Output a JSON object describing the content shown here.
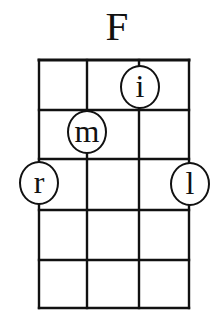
{
  "chord": {
    "name": "F",
    "strings": 4,
    "frets": 5,
    "grid": {
      "left": 39,
      "top": 60,
      "column_x": [
        39,
        87,
        139,
        189
      ],
      "row_y": [
        60,
        110,
        159,
        210,
        260,
        308
      ],
      "line_color": "#111111"
    },
    "fingers": [
      {
        "label": "i",
        "string": 3,
        "fret": 1,
        "x": 140,
        "y": 87
      },
      {
        "label": "m",
        "string": 2,
        "fret": 2,
        "x": 87,
        "y": 132
      },
      {
        "label": "r",
        "string": 1,
        "fret": 3,
        "x": 39,
        "y": 183
      },
      {
        "label": "l",
        "string": 4,
        "fret": 3,
        "x": 190,
        "y": 184
      }
    ]
  }
}
